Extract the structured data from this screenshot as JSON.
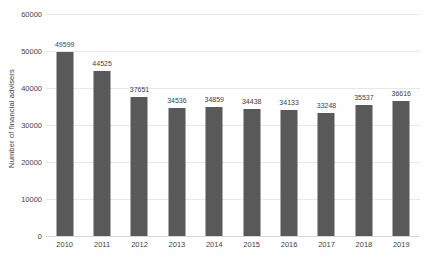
{
  "chart_data": {
    "type": "bar",
    "title": "",
    "subtitle": "",
    "xlabel": "",
    "ylabel": "Number of financial advisers",
    "categories": [
      "2010",
      "2011",
      "2012",
      "2013",
      "2014",
      "2015",
      "2016",
      "2017",
      "2018",
      "2019"
    ],
    "values": [
      49599,
      44525,
      37651,
      34536,
      34859,
      34438,
      34133,
      33248,
      35537,
      36616
    ],
    "data_labels": [
      "49599",
      "44525",
      "37651",
      "34536",
      "34859",
      "34438",
      "34133",
      "33248",
      "35537",
      "36616"
    ],
    "ylim": [
      0,
      60000
    ],
    "ytick_values": [
      0,
      10000,
      20000,
      30000,
      40000,
      50000,
      60000
    ],
    "ytick_labels": [
      "0",
      "10000",
      "20000",
      "30000",
      "40000",
      "50000",
      "60000"
    ],
    "grid": true,
    "legend": false,
    "legend_position": "none",
    "bar_color": "#595959",
    "gridline_color": "#e8e8e8",
    "text_color": "#3f3f3f",
    "background_color": "#ffffff"
  }
}
